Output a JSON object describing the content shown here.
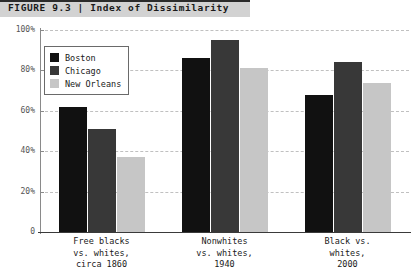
{
  "figure": {
    "label": "FIGURE 9.3",
    "separator": "|",
    "title": "Index of Dissimilarity",
    "header_text": "FIGURE 9.3  |  Index of Dissimilarity"
  },
  "colors": {
    "boston": "#111111",
    "chicago": "#383838",
    "new_orleans": "#c6c6c6",
    "header_band": "#d2d2d2",
    "header_border": "#2b2b2b",
    "gridline": "#c0c0c0",
    "axis": "#8a8a8a",
    "baseline": "#3a3a3a",
    "text": "#1a1a1a"
  },
  "chart_data": {
    "type": "bar",
    "title": "Index of Dissimilarity",
    "xlabel": "",
    "ylabel": "",
    "ylim": [
      0,
      100
    ],
    "grid": true,
    "legend_position": "top-left",
    "ytick_values": [
      0,
      20,
      40,
      60,
      80,
      100
    ],
    "ytick_labels": [
      "0",
      "20%",
      "40%",
      "60%",
      "80%",
      "100%"
    ],
    "categories": [
      "Free blacks vs. whites, circa 1860",
      "Nonwhites vs. whites, 1940",
      "Black vs. whites, 2000"
    ],
    "category_lines": [
      [
        "Free blacks",
        "vs. whites,",
        "circa 1860"
      ],
      [
        "Nonwhites",
        "vs. whites,",
        "1940"
      ],
      [
        "Black vs.",
        "whites,",
        "2000"
      ]
    ],
    "series": [
      {
        "name": "Boston",
        "color": "#111111",
        "values": [
          62,
          86,
          68
        ]
      },
      {
        "name": "Chicago",
        "color": "#383838",
        "values": [
          51,
          95,
          84
        ]
      },
      {
        "name": "New Orleans",
        "color": "#c6c6c6",
        "values": [
          37,
          81,
          74
        ]
      }
    ]
  },
  "legend": {
    "items": [
      {
        "label": "Boston",
        "color": "#111111"
      },
      {
        "label": "Chicago",
        "color": "#383838"
      },
      {
        "label": "New Orleans",
        "color": "#c6c6c6"
      }
    ]
  }
}
